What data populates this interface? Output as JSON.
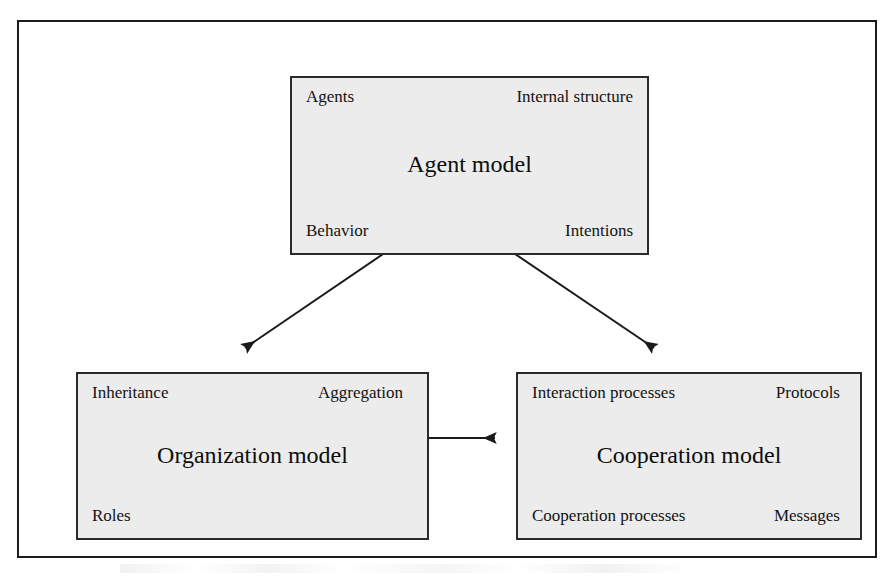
{
  "diagram": {
    "colors": {
      "box_fill": "#ececec",
      "box_border": "#2a2a2a",
      "frame_border": "#1c1c1c",
      "text": "#131313",
      "arrow": "#1a1a1a"
    },
    "boxes": [
      {
        "id": "agent-model",
        "title": "Agent model",
        "top_left": "Agents",
        "top_right": "Internal structure",
        "bottom_left": "Behavior",
        "bottom_right": "Intentions"
      },
      {
        "id": "organization-model",
        "title": "Organization model",
        "top_left": "Inheritance",
        "top_right": "Aggregation",
        "bottom_left": "Roles",
        "bottom_right": ""
      },
      {
        "id": "cooperation-model",
        "title": "Cooperation model",
        "top_left": "Interaction processes",
        "top_right": "Protocols",
        "bottom_left": "Cooperation processes",
        "bottom_right": "Messages"
      }
    ],
    "connectors": [
      {
        "id": "agent-organization",
        "from": "agent-model",
        "to": "organization-model",
        "style": "double-headed-arrow",
        "orientation": "diagonal-left"
      },
      {
        "id": "agent-cooperation",
        "from": "agent-model",
        "to": "cooperation-model",
        "style": "double-headed-arrow",
        "orientation": "diagonal-right"
      },
      {
        "id": "organization-cooperation",
        "from": "organization-model",
        "to": "cooperation-model",
        "style": "double-headed-arrow",
        "orientation": "horizontal"
      }
    ]
  }
}
